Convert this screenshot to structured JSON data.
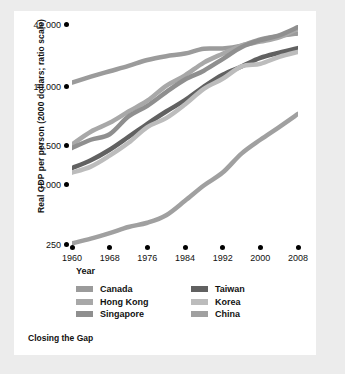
{
  "chart_data": {
    "type": "line",
    "title": "Closing the Gap",
    "xlabel": "Year",
    "ylabel": "Real GDP per person (2000 dollars; ratio scale)",
    "scale": "log",
    "grid": false,
    "legend_position": "bottom",
    "xlim": [
      1960,
      2008
    ],
    "ylim": [
      250,
      42000
    ],
    "yticks": [
      "250",
      "1,000",
      "2,500",
      "10,000",
      "42,000"
    ],
    "ytick_values": [
      250,
      1000,
      2500,
      10000,
      42000
    ],
    "xticks": [
      "1960",
      "1968",
      "1976",
      "1984",
      "1992",
      "2000",
      "2008"
    ],
    "xtick_values": [
      1960,
      1968,
      1976,
      1984,
      1992,
      2000,
      2008
    ],
    "x": [
      1960,
      1964,
      1968,
      1972,
      1976,
      1980,
      1984,
      1988,
      1992,
      1996,
      2000,
      2004,
      2008
    ],
    "series": [
      {
        "name": "Canada",
        "color": "#9b9b9b",
        "values": [
          11000,
          12600,
          14300,
          16200,
          18600,
          20300,
          21600,
          24200,
          24300,
          26000,
          30000,
          32500,
          34500
        ]
      },
      {
        "name": "Hong Kong",
        "color": "#a8a8a8",
        "values": [
          2600,
          3500,
          4300,
          5600,
          7200,
          10200,
          13000,
          17500,
          21500,
          26000,
          28500,
          31500,
          38500
        ]
      },
      {
        "name": "Singapore",
        "color": "#8f8f8f",
        "values": [
          2400,
          2900,
          3300,
          5000,
          6400,
          8800,
          11800,
          14500,
          19000,
          25000,
          29500,
          33000,
          40000
        ]
      },
      {
        "name": "Taiwan",
        "color": "#616161",
        "values": [
          1500,
          1800,
          2300,
          3100,
          4200,
          5600,
          7300,
          10000,
          13200,
          16000,
          19500,
          22000,
          24500
        ]
      },
      {
        "name": "Korea",
        "color": "#bcbcbc",
        "values": [
          1350,
          1550,
          2000,
          2700,
          3900,
          4800,
          6600,
          9500,
          12000,
          16000,
          17000,
          20000,
          22500
        ]
      },
      {
        "name": "China",
        "color": "#a0a0a0",
        "values": [
          260,
          290,
          330,
          380,
          420,
          500,
          700,
          1000,
          1350,
          2100,
          2900,
          3900,
          5300
        ]
      }
    ]
  },
  "legend": {
    "columns": [
      {
        "items": [
          {
            "label": "Canada",
            "color": "#9b9b9b"
          },
          {
            "label": "Hong Kong",
            "color": "#a8a8a8"
          },
          {
            "label": "Singapore",
            "color": "#8f8f8f"
          }
        ]
      },
      {
        "items": [
          {
            "label": "Taiwan",
            "color": "#616161"
          },
          {
            "label": "Korea",
            "color": "#bcbcbc"
          },
          {
            "label": "China",
            "color": "#a0a0a0"
          }
        ]
      }
    ]
  }
}
